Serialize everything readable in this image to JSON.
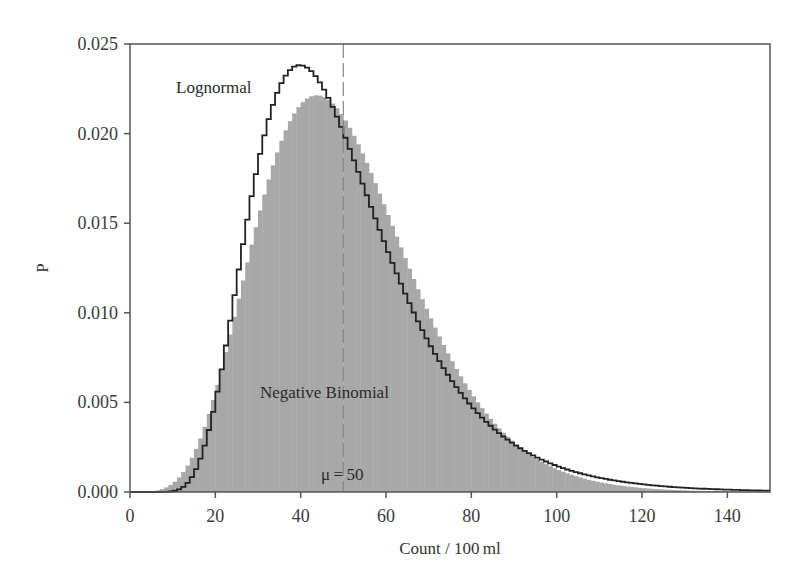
{
  "chart_data": {
    "type": "bar",
    "title": "",
    "xlabel": "Count / 100 ml",
    "ylabel": "P",
    "xlim": [
      0,
      150
    ],
    "ylim": [
      0,
      0.025
    ],
    "xticks": [
      0,
      20,
      40,
      60,
      80,
      100,
      120,
      140
    ],
    "yticks": [
      "0.000",
      "0.005",
      "0.010",
      "0.015",
      "0.020",
      "0.025"
    ],
    "grid": false,
    "series": [
      {
        "name": "Negative Binomial",
        "style": "filled-histogram",
        "color": "#a8a8a8",
        "mean": 50,
        "shape_k": 8,
        "x": [
          0,
          5,
          10,
          15,
          20,
          25,
          30,
          35,
          40,
          42,
          45,
          50,
          55,
          60,
          65,
          70,
          75,
          80,
          85,
          90,
          95,
          100,
          110,
          120,
          130,
          140,
          150
        ],
        "values": [
          0.0,
          0.0,
          0.0003,
          0.0016,
          0.0042,
          0.0081,
          0.0124,
          0.0164,
          0.0195,
          0.0206,
          0.0203,
          0.0193,
          0.0175,
          0.0152,
          0.0128,
          0.0104,
          0.0083,
          0.0064,
          0.0049,
          0.0036,
          0.0027,
          0.0019,
          0.0009,
          0.0004,
          0.0002,
          0.0001,
          0.0
        ]
      },
      {
        "name": "Lognormal",
        "style": "step-outline",
        "color": "#222222",
        "mean": 50,
        "sigma_log": 0.39,
        "x": [
          0,
          5,
          10,
          15,
          20,
          25,
          30,
          35,
          40,
          45,
          50,
          55,
          60,
          65,
          70,
          75,
          80,
          85,
          90,
          95,
          100,
          110,
          120,
          130,
          140,
          150
        ],
        "values": [
          0.0,
          0.0,
          0.0,
          0.0005,
          0.0029,
          0.0087,
          0.016,
          0.0215,
          0.0235,
          0.0225,
          0.0196,
          0.0161,
          0.0127,
          0.0097,
          0.0072,
          0.0053,
          0.0039,
          0.0028,
          0.002,
          0.0014,
          0.001,
          0.0005,
          0.0002,
          0.0001,
          0.0,
          0.0
        ]
      }
    ],
    "annotations": [
      {
        "text": "Lognormal",
        "x": 26,
        "y": 0.0228
      },
      {
        "text": "Negative Binomial",
        "x": 53,
        "y": 0.0055
      },
      {
        "text": "μ = 50",
        "x": 50,
        "y": 0.0012
      },
      {
        "type": "vline",
        "x": 50,
        "style": "dashed"
      }
    ]
  },
  "labels": {
    "lognormal": "Lognormal",
    "negbin": "Negative Binomial",
    "mu": "μ = 50",
    "xlabel": "Count / 100 ml",
    "ylabel": "P"
  }
}
